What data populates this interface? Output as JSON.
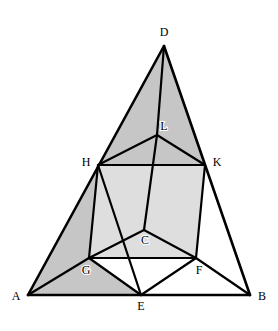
{
  "figure": {
    "canvas": {
      "width": 278,
      "height": 331
    },
    "background_color": "#ffffff",
    "stroke_color": "#000000",
    "fill_dark_gray": "#c6c6c6",
    "fill_light_gray": "#dedede",
    "fill_white": "#ffffff",
    "stroke_width_outer": 2.6,
    "stroke_width_inner": 2.2,
    "points": {
      "A": {
        "x": 28,
        "y": 295,
        "label": "A",
        "label_x": 16,
        "label_y": 297
      },
      "B": {
        "x": 250,
        "y": 295,
        "label": "B",
        "label_x": 262,
        "label_y": 297
      },
      "C": {
        "x": 144,
        "y": 230,
        "label": "C",
        "label_x": 145,
        "label_y": 241
      },
      "D": {
        "x": 164,
        "y": 46,
        "label": "D",
        "label_x": 164,
        "label_y": 33
      },
      "E": {
        "x": 141,
        "y": 295,
        "label": "E",
        "label_x": 141,
        "label_y": 307
      },
      "F": {
        "x": 196,
        "y": 258,
        "label": "F",
        "label_x": 199,
        "label_y": 271
      },
      "G": {
        "x": 89,
        "y": 258,
        "label": "G",
        "label_x": 86,
        "label_y": 271
      },
      "H": {
        "x": 98,
        "y": 165,
        "label": "H",
        "label_x": 86,
        "label_y": 163
      },
      "K": {
        "x": 205,
        "y": 165,
        "label": "K",
        "label_x": 217,
        "label_y": 163
      },
      "L": {
        "x": 157,
        "y": 135,
        "label": "L",
        "label_x": 164,
        "label_y": 127
      }
    },
    "regions": [
      {
        "name": "triangle-DHK",
        "polygon": "D,H,K",
        "fill": "#c6c6c6"
      },
      {
        "name": "region-AHGE",
        "polygon": "A,H,G,E",
        "fill": "#c6c6c6"
      },
      {
        "name": "square-HKFG",
        "polygon": "H,K,F,G",
        "fill": "#dedede"
      },
      {
        "name": "triangle-KFB",
        "polygon": "K,F,B",
        "fill": "#ffffff"
      },
      {
        "name": "triangle-GEF",
        "polygon": "G,E,F",
        "fill": "#ffffff"
      }
    ],
    "edges": [
      {
        "name": "edge-AB",
        "from": "A",
        "to": "B",
        "weight": "outer"
      },
      {
        "name": "edge-AD",
        "from": "A",
        "to": "D",
        "weight": "outer"
      },
      {
        "name": "edge-BD",
        "from": "B",
        "to": "D",
        "weight": "outer"
      },
      {
        "name": "edge-HK",
        "from": "H",
        "to": "K",
        "weight": "inner"
      },
      {
        "name": "edge-HG",
        "from": "H",
        "to": "G",
        "weight": "inner"
      },
      {
        "name": "edge-KF",
        "from": "K",
        "to": "F",
        "weight": "inner"
      },
      {
        "name": "edge-GF",
        "from": "G",
        "to": "F",
        "weight": "inner"
      },
      {
        "name": "edge-DL",
        "from": "D",
        "to": "L",
        "weight": "inner"
      },
      {
        "name": "edge-HL",
        "from": "H",
        "to": "L",
        "weight": "inner"
      },
      {
        "name": "edge-KL",
        "from": "K",
        "to": "L",
        "weight": "inner"
      },
      {
        "name": "edge-LC",
        "from": "L",
        "to": "C",
        "weight": "inner"
      },
      {
        "name": "edge-GC",
        "from": "G",
        "to": "C",
        "weight": "inner"
      },
      {
        "name": "edge-FC",
        "from": "F",
        "to": "C",
        "weight": "inner"
      },
      {
        "name": "edge-AG",
        "from": "A",
        "to": "G",
        "weight": "inner"
      },
      {
        "name": "edge-HE",
        "from": "H",
        "to": "E",
        "weight": "inner"
      },
      {
        "name": "edge-GE",
        "from": "G",
        "to": "E",
        "weight": "inner"
      },
      {
        "name": "edge-FE",
        "from": "F",
        "to": "E",
        "weight": "inner"
      },
      {
        "name": "edge-FB",
        "from": "F",
        "to": "B",
        "weight": "inner"
      }
    ],
    "label_order": [
      "D",
      "L",
      "H",
      "K",
      "C",
      "G",
      "F",
      "A",
      "E",
      "B"
    ]
  }
}
